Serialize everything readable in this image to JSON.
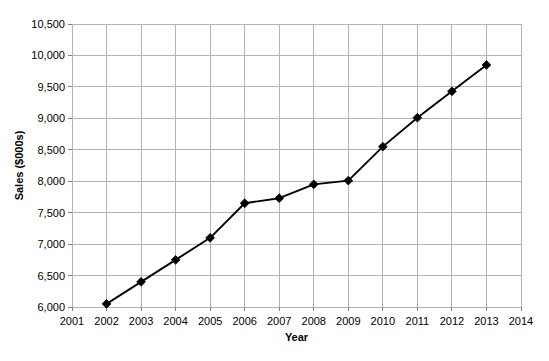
{
  "chart_data": {
    "type": "line",
    "title": "",
    "xlabel": "Year",
    "ylabel": "Sales ($000s)",
    "x": [
      2002,
      2003,
      2004,
      2005,
      2006,
      2007,
      2008,
      2009,
      2010,
      2011,
      2012,
      2013
    ],
    "values": [
      6050,
      6400,
      6750,
      7100,
      7650,
      7730,
      7950,
      8010,
      8550,
      9010,
      9430,
      9850
    ],
    "series": [
      {
        "name": "Sales",
        "values": [
          6050,
          6400,
          6750,
          7100,
          7650,
          7730,
          7950,
          8010,
          8550,
          9010,
          9430,
          9850
        ]
      }
    ],
    "xlim": [
      2001,
      2014
    ],
    "ylim": [
      6000,
      10500
    ],
    "xticks": [
      2001,
      2002,
      2003,
      2004,
      2005,
      2006,
      2007,
      2008,
      2009,
      2010,
      2011,
      2012,
      2013,
      2014
    ],
    "xtick_labels": [
      "2001",
      "2002",
      "2003",
      "2004",
      "2005",
      "2006",
      "2007",
      "2008",
      "2009",
      "2010",
      "2011",
      "2012",
      "2013",
      "2014"
    ],
    "yticks": [
      6000,
      6500,
      7000,
      7500,
      8000,
      8500,
      9000,
      9500,
      10000,
      10500
    ],
    "ytick_labels": [
      "6,000",
      "6,500",
      "7,000",
      "7,500",
      "8,000",
      "8,500",
      "9,000",
      "9,500",
      "10,000",
      "10,500"
    ],
    "grid": true,
    "grid_x": true,
    "grid_y": true,
    "legend": false,
    "legend_position": "none",
    "marker": "diamond",
    "line_color": "#000000",
    "marker_color": "#000000",
    "grid_color": "#b4b4b4",
    "background_color": "#ffffff",
    "axis_color": "#808080"
  },
  "axis": {
    "x_title": "Year",
    "y_title": "Sales ($000s)"
  }
}
